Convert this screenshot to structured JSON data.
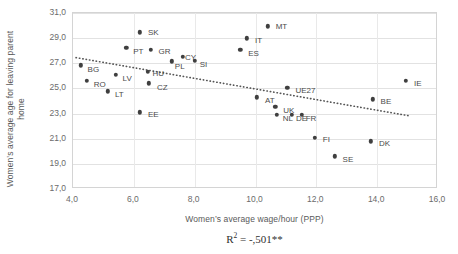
{
  "chart_data": {
    "type": "scatter",
    "title": "",
    "xlabel": "Women’s average wage/hour (PPP)",
    "ylabel": "Women’s average age for leaving parent home",
    "xlim": [
      4.0,
      16.0
    ],
    "ylim": [
      17.0,
      31.0
    ],
    "xticks": [
      "4,0",
      "6,0",
      "8,0",
      "10,0",
      "12,0",
      "14,0",
      "16,0"
    ],
    "xtick_values": [
      4.0,
      6.0,
      8.0,
      10.0,
      12.0,
      14.0,
      16.0
    ],
    "yticks": [
      "17,0",
      "19,0",
      "21,0",
      "23,0",
      "25,0",
      "27,0",
      "29,0",
      "31,0"
    ],
    "ytick_values": [
      17.0,
      19.0,
      21.0,
      23.0,
      25.0,
      27.0,
      29.0,
      31.0
    ],
    "grid": true,
    "legend": false,
    "annotation": "R2 = -,501**",
    "annotation_parts": {
      "base": "R",
      "exponent": "2",
      "rest": " = -,501**"
    },
    "point_color": "#3f3f3f",
    "trendline": {
      "style": "dotted",
      "color": "#555555",
      "x_start": 4.1,
      "y_start": 27.45,
      "x_end": 15.1,
      "y_end": 22.8
    },
    "points": [
      {
        "label": "BG",
        "x": 4.25,
        "y": 26.85,
        "label_dx": 7,
        "label_dy": 4
      },
      {
        "label": "RO",
        "x": 4.45,
        "y": 25.6,
        "label_dx": 7,
        "label_dy": 3
      },
      {
        "label": "LT",
        "x": 5.15,
        "y": 24.78,
        "label_dx": 7,
        "label_dy": 3
      },
      {
        "label": "LV",
        "x": 5.4,
        "y": 26.1,
        "label_dx": 7,
        "label_dy": 3
      },
      {
        "label": "PT",
        "x": 5.75,
        "y": 28.25,
        "label_dx": 7,
        "label_dy": 3
      },
      {
        "label": "SK",
        "x": 6.2,
        "y": 29.45,
        "label_dx": 8,
        "label_dy": 0
      },
      {
        "label": "EE",
        "x": 6.2,
        "y": 23.1,
        "label_dx": 8,
        "label_dy": 2
      },
      {
        "label": "HU",
        "x": 6.45,
        "y": 26.3,
        "label_dx": 5,
        "label_dy": 1
      },
      {
        "label": "CZ",
        "x": 6.5,
        "y": 25.4,
        "label_dx": 8,
        "label_dy": 4
      },
      {
        "label": "GR",
        "x": 6.55,
        "y": 28.05,
        "label_dx": 8,
        "label_dy": 1
      },
      {
        "label": "PL",
        "x": 7.25,
        "y": 27.15,
        "label_dx": 3,
        "label_dy": 5
      },
      {
        "label": "CY",
        "x": 7.62,
        "y": 27.5,
        "label_dx": 2,
        "label_dy": 0
      },
      {
        "label": "SI",
        "x": 8.0,
        "y": 27.2,
        "label_dx": 5,
        "label_dy": 3
      },
      {
        "label": "ES",
        "x": 9.5,
        "y": 28.05,
        "label_dx": 8,
        "label_dy": 3
      },
      {
        "label": "IT",
        "x": 9.72,
        "y": 28.98,
        "label_dx": 8,
        "label_dy": 2
      },
      {
        "label": "AT",
        "x": 10.05,
        "y": 24.3,
        "label_dx": 8,
        "label_dy": 3
      },
      {
        "label": "MT",
        "x": 10.4,
        "y": 29.95,
        "label_dx": 8,
        "label_dy": 0
      },
      {
        "label": "UK",
        "x": 10.65,
        "y": 23.55,
        "label_dx": 8,
        "label_dy": 3
      },
      {
        "label": "NL",
        "x": 10.7,
        "y": 22.88,
        "label_dx": 6,
        "label_dy": 3
      },
      {
        "label": "UE27",
        "x": 11.05,
        "y": 25.05,
        "label_dx": 8,
        "label_dy": 2
      },
      {
        "label": "DE",
        "x": 11.2,
        "y": 22.88,
        "label_dx": 4,
        "label_dy": 3
      },
      {
        "label": "FR",
        "x": 11.52,
        "y": 22.9,
        "label_dx": 4,
        "label_dy": 3
      },
      {
        "label": "FI",
        "x": 11.95,
        "y": 21.05,
        "label_dx": 8,
        "label_dy": 1
      },
      {
        "label": "SE",
        "x": 12.6,
        "y": 19.6,
        "label_dx": 8,
        "label_dy": 3
      },
      {
        "label": "DK",
        "x": 13.8,
        "y": 20.8,
        "label_dx": 8,
        "label_dy": 2
      },
      {
        "label": "BE",
        "x": 13.85,
        "y": 24.15,
        "label_dx": 8,
        "label_dy": 2
      },
      {
        "label": "IE",
        "x": 14.95,
        "y": 25.6,
        "label_dx": 8,
        "label_dy": 2
      }
    ]
  }
}
